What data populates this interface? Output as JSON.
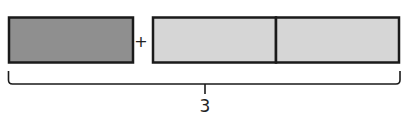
{
  "diagram": {
    "type": "tape-diagram",
    "colors": {
      "dark_fill": "#8f8f8f",
      "light_fill": "#d6d6d6",
      "stroke": "#1a1a1a"
    },
    "parts": [
      {
        "shade": "dark",
        "count": 1
      },
      {
        "shade": "light",
        "count": 2
      }
    ],
    "operator": "+",
    "bracket_label": "3"
  }
}
